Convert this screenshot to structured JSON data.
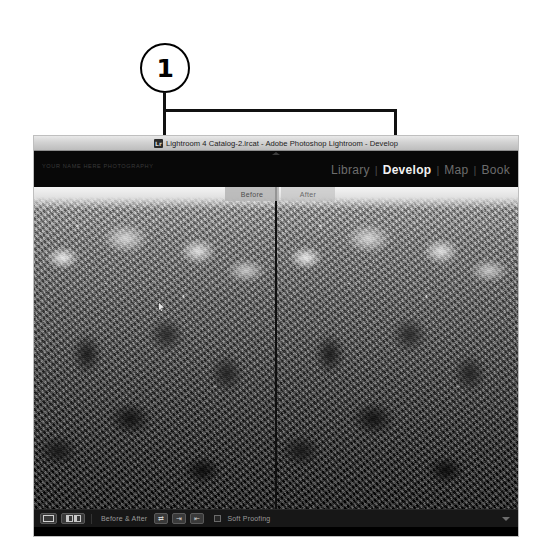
{
  "callout": {
    "number": "1"
  },
  "window": {
    "titlebar": {
      "icon": "lightroom-app-icon",
      "title": "Lightroom 4 Catalog-2.lrcat - Adobe Photoshop Lightroom - Develop"
    },
    "header": {
      "identity_plate": "YOUR NAME HERE PHOTOGRAPHY",
      "collapse_icon": "collapse-triangle-icon",
      "modules": [
        {
          "label": "Library",
          "active": false
        },
        {
          "label": "Develop",
          "active": true
        },
        {
          "label": "Map",
          "active": false
        },
        {
          "label": "Book",
          "active": false
        }
      ],
      "separator": "|"
    },
    "content": {
      "before_after_tabs": [
        {
          "label": "Before"
        },
        {
          "label": "After"
        }
      ],
      "panes": [
        {
          "name": "before-pane"
        },
        {
          "name": "after-pane"
        }
      ]
    },
    "toolbar": {
      "view_loupe_icon": "loupe-view-icon",
      "view_compare_icon": "before-after-view-icon",
      "mode_label": "Before & After",
      "swap_icon": "swap-before-after-icon",
      "copy_before_to_after_icon": "copy-before-settings-icon",
      "copy_after_to_before_icon": "copy-after-settings-icon",
      "soft_proofing_checkbox": "soft-proofing-checkbox",
      "soft_proofing_label": "Soft Proofing",
      "toolbar_toggle_icon": "toolbar-caret-icon"
    }
  },
  "colors": {
    "page_background": "#ffffff",
    "callout_line": "#111111",
    "window_chrome": "#080808",
    "titlebar_gradient_top": "#e9e9e9",
    "titlebar_gradient_bottom": "#bdbdbd",
    "module_active_text": "#f2f2f2",
    "module_inactive_text": "#6d6d6d",
    "toolbar_background": "#171717",
    "toolbar_text": "#9b9b9b",
    "tab_background": "#b2b2b2"
  }
}
